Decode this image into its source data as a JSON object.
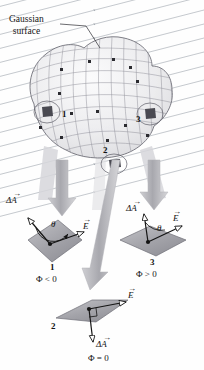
{
  "figure": {
    "type": "physics-diagram",
    "topic": "Electric flux through a Gaussian surface",
    "background_color": "#fefefe",
    "ink_color": "#141414"
  },
  "annotation": {
    "gaussian_label_line1": "Gaussian",
    "gaussian_label_line2": "surface",
    "leader_line": "leader-line-to-surface"
  },
  "field": {
    "name": "electric-field-lines",
    "description": "uniform parallel field lines with arrowheads",
    "direction": "up-and-right",
    "line_color": "#9aa0a8",
    "count": 22
  },
  "surface": {
    "name": "gaussian-surface",
    "mesh_color": "#8c8c94",
    "fill_color": "#f0f0f2",
    "patch_markers": [
      "1",
      "2",
      "3"
    ],
    "dot_count": 14
  },
  "callout_arrows": [
    {
      "name": "callout-arrow-left",
      "target": "panel-1"
    },
    {
      "name": "callout-arrow-middle",
      "target": "panel-2"
    },
    {
      "name": "callout-arrow-right",
      "target": "panel-3"
    }
  ],
  "panels": [
    {
      "id": "panel-1",
      "number": "1",
      "flux_label": "Φ < 0",
      "area_vector_label": "ΔA",
      "field_vector_label": "E",
      "angle_label": "θ",
      "angle_description": "obtuse angle between delta-A and E",
      "patch_fill": "#a9a9ae"
    },
    {
      "id": "panel-2",
      "number": "2",
      "flux_label": "Φ = 0",
      "area_vector_label": "ΔA",
      "field_vector_label": "E",
      "angle_label": "",
      "angle_description": "right angle between delta-A and E",
      "patch_fill": "#a9a9ae"
    },
    {
      "id": "panel-3",
      "number": "3",
      "flux_label": "Φ > 0",
      "area_vector_label": "ΔA",
      "field_vector_label": "E",
      "angle_label": "θ",
      "angle_description": "acute angle between delta-A and E",
      "patch_fill": "#a9a9ae"
    }
  ]
}
